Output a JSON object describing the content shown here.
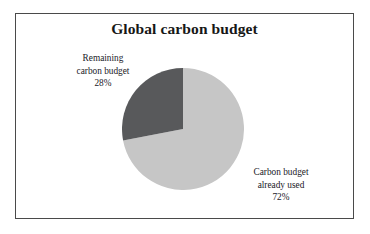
{
  "figure": {
    "title": "Global carbon budget",
    "frame_color": "#4a4a4a",
    "background": "#ffffff"
  },
  "labels": {
    "remaining": {
      "line1": "Remaining",
      "line2": "carbon budget",
      "percent": "28%"
    },
    "used": {
      "line1": "Carbon budget",
      "line2": "already used",
      "percent": "72%"
    }
  },
  "chart_data": {
    "type": "pie",
    "title": "Global carbon budget",
    "subtitle": "",
    "xlabel": "",
    "ylabel": "",
    "categories": [
      "Carbon budget already used",
      "Remaining carbon budget"
    ],
    "values": [
      72,
      28
    ],
    "value_unit": "%",
    "data_labels": [
      "72%",
      "28%"
    ],
    "colors": [
      "#c6c6c6",
      "#58595b"
    ],
    "legend": "none",
    "legend_position": "none",
    "grid": false,
    "start_angle_deg": 0,
    "direction": "clockwise",
    "annotations": [
      {
        "text": "Remaining carbon budget 28%",
        "target": "Remaining carbon budget",
        "position": "upper-left"
      },
      {
        "text": "Carbon budget already used 72%",
        "target": "Carbon budget already used",
        "position": "lower-right"
      }
    ],
    "slices": [
      {
        "label": "Carbon budget already used",
        "value": 72,
        "display": "72%",
        "color": "#c6c6c6"
      },
      {
        "label": "Remaining carbon budget",
        "value": 28,
        "display": "28%",
        "color": "#58595b"
      }
    ]
  }
}
